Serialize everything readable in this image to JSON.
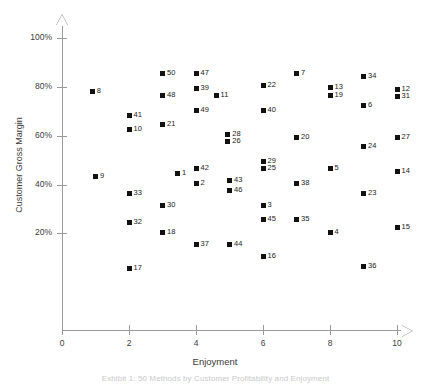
{
  "chart_data": {
    "type": "scatter",
    "title": "",
    "xlabel": "Enjoyment",
    "ylabel": "Customer Gross Margin",
    "xlim": [
      0,
      10
    ],
    "ylim": [
      0,
      1.06
    ],
    "grid": false,
    "legend": false,
    "xticks": [
      "0",
      "2",
      "4",
      "6",
      "8",
      "10"
    ],
    "xtick_values": [
      0,
      2,
      4,
      6,
      8,
      10
    ],
    "yticks": [
      "20%",
      "40%",
      "60%",
      "80%",
      "100%"
    ],
    "ytick_values": [
      0.2,
      0.4,
      0.6,
      0.8,
      1.0
    ],
    "point_labels_position": "right",
    "marker": "square",
    "marker_color": "#111111",
    "axis_color": "#9a9a9a",
    "points": [
      {
        "label": "8",
        "x": 0.9,
        "y": 0.78
      },
      {
        "label": "9",
        "x": 1.0,
        "y": 0.435
      },
      {
        "label": "41",
        "x": 2.0,
        "y": 0.685
      },
      {
        "label": "10",
        "x": 2.0,
        "y": 0.625
      },
      {
        "label": "33",
        "x": 2.0,
        "y": 0.365
      },
      {
        "label": "32",
        "x": 2.0,
        "y": 0.245
      },
      {
        "label": "17",
        "x": 2.0,
        "y": 0.055
      },
      {
        "label": "50",
        "x": 3.0,
        "y": 0.855
      },
      {
        "label": "48",
        "x": 3.0,
        "y": 0.765
      },
      {
        "label": "21",
        "x": 3.0,
        "y": 0.645
      },
      {
        "label": "30",
        "x": 3.0,
        "y": 0.315
      },
      {
        "label": "18",
        "x": 3.0,
        "y": 0.205
      },
      {
        "label": "1",
        "x": 3.45,
        "y": 0.445
      },
      {
        "label": "47",
        "x": 4.0,
        "y": 0.855
      },
      {
        "label": "39",
        "x": 4.0,
        "y": 0.795
      },
      {
        "label": "49",
        "x": 4.0,
        "y": 0.705
      },
      {
        "label": "42",
        "x": 4.0,
        "y": 0.465
      },
      {
        "label": "2",
        "x": 4.0,
        "y": 0.405
      },
      {
        "label": "37",
        "x": 4.0,
        "y": 0.155
      },
      {
        "label": "11",
        "x": 4.6,
        "y": 0.765
      },
      {
        "label": "28",
        "x": 4.95,
        "y": 0.605
      },
      {
        "label": "26",
        "x": 4.95,
        "y": 0.575
      },
      {
        "label": "43",
        "x": 5.0,
        "y": 0.415
      },
      {
        "label": "46",
        "x": 5.0,
        "y": 0.375
      },
      {
        "label": "44",
        "x": 5.0,
        "y": 0.155
      },
      {
        "label": "22",
        "x": 6.0,
        "y": 0.805
      },
      {
        "label": "40",
        "x": 6.0,
        "y": 0.705
      },
      {
        "label": "29",
        "x": 6.0,
        "y": 0.495
      },
      {
        "label": "25",
        "x": 6.0,
        "y": 0.465
      },
      {
        "label": "3",
        "x": 6.0,
        "y": 0.315
      },
      {
        "label": "45",
        "x": 6.0,
        "y": 0.255
      },
      {
        "label": "16",
        "x": 6.0,
        "y": 0.105
      },
      {
        "label": "7",
        "x": 7.0,
        "y": 0.855
      },
      {
        "label": "20",
        "x": 7.0,
        "y": 0.595
      },
      {
        "label": "38",
        "x": 7.0,
        "y": 0.405
      },
      {
        "label": "35",
        "x": 7.0,
        "y": 0.255
      },
      {
        "label": "13",
        "x": 8.0,
        "y": 0.8
      },
      {
        "label": "19",
        "x": 8.0,
        "y": 0.765
      },
      {
        "label": "5",
        "x": 8.0,
        "y": 0.465
      },
      {
        "label": "4",
        "x": 8.0,
        "y": 0.205
      },
      {
        "label": "34",
        "x": 9.0,
        "y": 0.845
      },
      {
        "label": "6",
        "x": 9.0,
        "y": 0.725
      },
      {
        "label": "24",
        "x": 9.0,
        "y": 0.555
      },
      {
        "label": "23",
        "x": 9.0,
        "y": 0.365
      },
      {
        "label": "36",
        "x": 9.0,
        "y": 0.065
      },
      {
        "label": "12",
        "x": 10.0,
        "y": 0.79
      },
      {
        "label": "31",
        "x": 10.0,
        "y": 0.76
      },
      {
        "label": "27",
        "x": 10.0,
        "y": 0.595
      },
      {
        "label": "14",
        "x": 10.0,
        "y": 0.455
      },
      {
        "label": "15",
        "x": 10.0,
        "y": 0.225
      }
    ]
  },
  "caption": "Exhibit 1: 50 Methods by Customer Profitability and Enjoyment"
}
